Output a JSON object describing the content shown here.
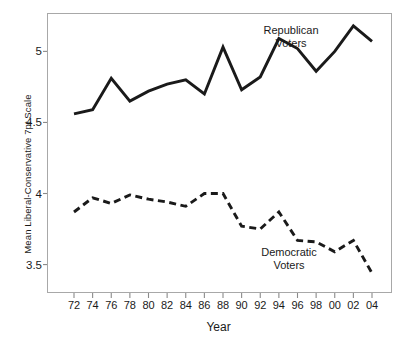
{
  "chart_data": {
    "type": "line",
    "title": "",
    "xlabel": "Year",
    "ylabel": "Mean Liberal-Conservative 7pt Scale",
    "x": [
      1972,
      1974,
      1976,
      1978,
      1980,
      1982,
      1984,
      1986,
      1988,
      1990,
      1992,
      1994,
      1996,
      1998,
      2000,
      2002,
      2004
    ],
    "xtick_labels": [
      "72",
      "74",
      "76",
      "78",
      "80",
      "82",
      "84",
      "86",
      "88",
      "90",
      "92",
      "94",
      "96",
      "98",
      "00",
      "02",
      "04"
    ],
    "ytick_labels": [
      "3.5",
      "4",
      "4.5",
      "5"
    ],
    "ytick_values": [
      3.5,
      4,
      4.5,
      5
    ],
    "xlim": [
      1971,
      2005
    ],
    "ylim": [
      3.3,
      5.27
    ],
    "grid": false,
    "legend_position": "inline-annotations",
    "series": [
      {
        "name": "Republican Voters",
        "annotation": "Republican\nVoters",
        "annotation_line1": "Republican",
        "annotation_line2": "Voters",
        "style": "solid",
        "color": "#1a1a1a",
        "values": [
          4.56,
          4.59,
          4.81,
          4.65,
          4.72,
          4.77,
          4.8,
          4.7,
          5.03,
          4.73,
          4.82,
          5.09,
          5.02,
          4.86,
          5.0,
          5.18,
          5.07
        ]
      },
      {
        "name": "Democratic Voters",
        "annotation": "Democratic\nVoters",
        "annotation_line1": "Democratic",
        "annotation_line2": "Voters",
        "style": "dashed",
        "color": "#1a1a1a",
        "values": [
          3.87,
          3.97,
          3.93,
          3.99,
          3.96,
          3.94,
          3.91,
          4.0,
          4.0,
          3.77,
          3.75,
          3.87,
          3.67,
          3.66,
          3.59,
          3.67,
          3.44
        ]
      }
    ]
  }
}
